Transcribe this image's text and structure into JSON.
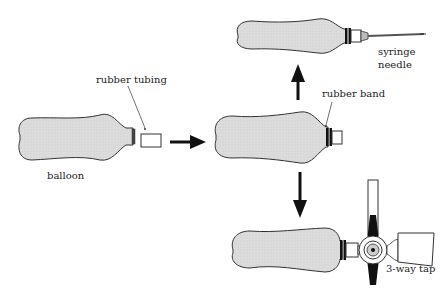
{
  "labels": {
    "rubber_tubing": "rubber tubing",
    "balloon": "balloon",
    "rubber_band": "rubber band",
    "syringe_needle_line1": "syringe",
    "syringe_needle_line2": "needle",
    "three_way_tap": "3-way tap"
  },
  "colors": {
    "balloon_fill": "#d9d9d9",
    "stroke": "#333333",
    "arrow": "#111111",
    "tap_handle": "#111111"
  },
  "steps": [
    {
      "id": "balloon",
      "description": "balloon with rubber tubing"
    },
    {
      "id": "balloon-with-tubing",
      "description": "tubing attached with rubber band"
    },
    {
      "id": "balloon-with-needle",
      "description": "syringe needle attached"
    },
    {
      "id": "balloon-with-tap",
      "description": "3-way tap attached"
    }
  ]
}
